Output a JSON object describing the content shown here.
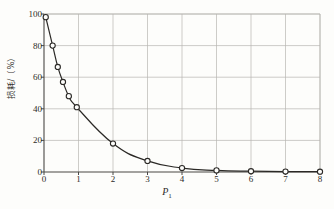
{
  "chart_data": {
    "type": "line",
    "title": "",
    "xlabel": "P₁",
    "xlabel_base": "P",
    "xlabel_sub": "1",
    "ylabel": "损耗/（%）",
    "xlim": [
      0,
      8
    ],
    "ylim": [
      0,
      100
    ],
    "xticks": [
      0,
      1,
      2,
      3,
      4,
      5,
      6,
      7,
      8
    ],
    "yticks": [
      0,
      20,
      40,
      60,
      80,
      100
    ],
    "xtick_labels": [
      "0",
      "1",
      "2",
      "3",
      "4",
      "5",
      "6",
      "7",
      "8"
    ],
    "ytick_labels": [
      "0",
      "20",
      "40",
      "60",
      "80",
      "100"
    ],
    "grid": true,
    "grid_x": true,
    "grid_y": true,
    "legend": false,
    "marker": "open-circle",
    "line_color": "#2b2926",
    "grid_color": "#b8b6b1",
    "axis_color": "#4a4845",
    "series": [
      {
        "name": "loss",
        "x": [
          0.05,
          0.25,
          0.4,
          0.55,
          0.72,
          0.95,
          2.0,
          3.0,
          4.0,
          5.0,
          6.0,
          7.0,
          8.0
        ],
        "y": [
          98,
          80,
          66.5,
          57,
          48,
          41,
          18,
          7,
          2.5,
          1.0,
          0.5,
          0.3,
          0.2
        ]
      }
    ]
  },
  "figure": {
    "caption": ""
  }
}
